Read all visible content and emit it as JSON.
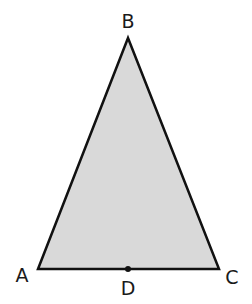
{
  "diagram": {
    "type": "triangle",
    "fill_color": "#d9d9d9",
    "stroke_color": "#111111",
    "stroke_width": 2.5,
    "vertices": {
      "A": {
        "x": 38,
        "y": 269
      },
      "B": {
        "x": 128,
        "y": 38
      },
      "C": {
        "x": 219,
        "y": 269
      }
    },
    "points": {
      "D": {
        "x": 128,
        "y": 269
      }
    },
    "labels": {
      "A": {
        "text": "A",
        "x": 22,
        "y": 282
      },
      "B": {
        "text": "B",
        "x": 128,
        "y": 28
      },
      "C": {
        "text": "C",
        "x": 232,
        "y": 284
      },
      "D": {
        "text": "D",
        "x": 128,
        "y": 295
      }
    }
  }
}
